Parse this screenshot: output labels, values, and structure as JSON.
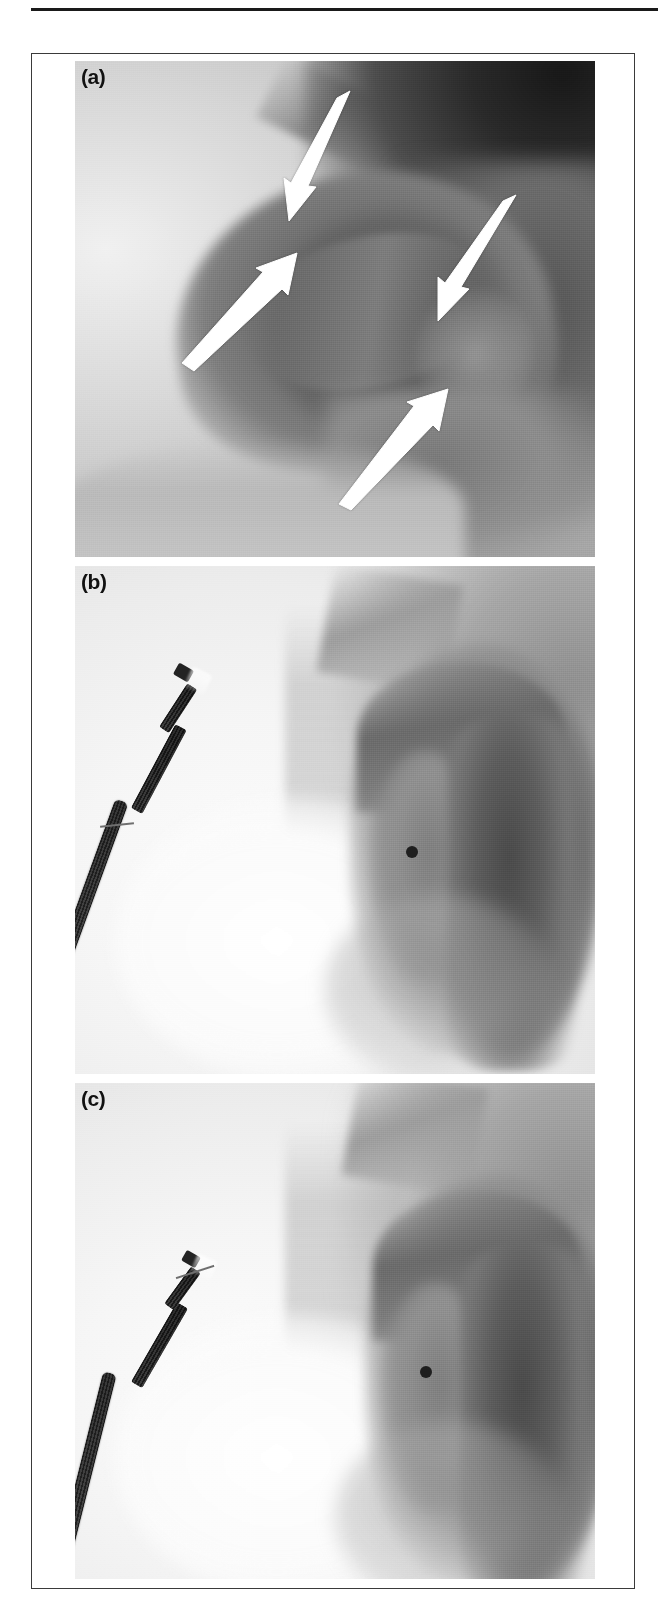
{
  "figure": {
    "kind": "fluoroscopy-angiography-figure",
    "top_rule": true,
    "frame_border_color": "#3a3a3a",
    "panels": [
      {
        "id": "a",
        "label": "(a)",
        "modality": "aortography",
        "description": "Aortogram showing the aortic arch with intimal flap; four white arrows mark the dissection flap margins",
        "background_tone": "dark-grey",
        "annotations": {
          "arrow_count": 4,
          "arrow_color": "#ffffff",
          "arrows": [
            {
              "name": "arrow-1",
              "direction": "down-left",
              "tail_x": 334,
              "tail_y": 143,
              "tip_x": 296,
              "tip_y": 224
            },
            {
              "name": "arrow-2",
              "direction": "up-right",
              "tail_x": 185,
              "tail_y": 366,
              "tip_x": 282,
              "tip_y": 277
            },
            {
              "name": "arrow-3",
              "direction": "down-left",
              "tail_x": 496,
              "tail_y": 255,
              "tip_x": 440,
              "tip_y": 330
            },
            {
              "name": "arrow-4",
              "direction": "up-right",
              "tail_x": 350,
              "tail_y": 505,
              "tip_x": 417,
              "tip_y": 408
            }
          ]
        }
      },
      {
        "id": "b",
        "label": "(b)",
        "modality": "aortography",
        "description": "Aortogram with transoesophageal echocardiography probe in situ; contrast opacified aortic arch and descending aorta with radiopaque marker",
        "background_tone": "light-grey",
        "devices": [
          {
            "name": "tee-probe",
            "tip_x": 175,
            "tip_y": 183,
            "entry_x": 78,
            "entry_y": 430
          },
          {
            "name": "radiopaque-marker-dot",
            "x": 412,
            "y": 851
          }
        ]
      },
      {
        "id": "c",
        "label": "(c)",
        "modality": "aortography",
        "description": "Follow-up aortogram with transoesophageal echocardiography probe withdrawn lower; aortic arch and descending aorta opacified with radiopaque marker",
        "background_tone": "light-grey",
        "devices": [
          {
            "name": "tee-probe",
            "tip_x": 185,
            "tip_y": 210,
            "entry_x": 66,
            "entry_y": 492
          },
          {
            "name": "radiopaque-marker-dot",
            "x": 425,
            "y": 1372
          }
        ]
      }
    ]
  }
}
